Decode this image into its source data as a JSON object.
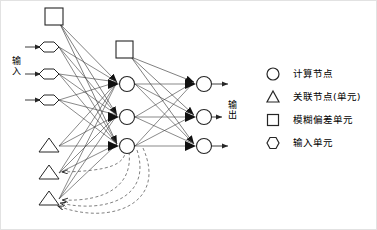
{
  "figure": {
    "title": "",
    "type": "neural-network-architecture-diagram"
  },
  "labels": {
    "input": "输入",
    "output": "输出"
  },
  "legend": {
    "items": [
      {
        "icon": "circle-icon",
        "shape": "circle",
        "label": "计算节点"
      },
      {
        "icon": "triangle-icon",
        "shape": "triangle",
        "label": "关联节点(单元)"
      },
      {
        "icon": "square-icon",
        "shape": "square",
        "label": "模糊偏差单元"
      },
      {
        "icon": "hexagon-icon",
        "shape": "hexagon",
        "label": "输入单元"
      }
    ]
  },
  "colors": {
    "stroke": "#262626",
    "fill": "#ffffff",
    "dashed": "#555555",
    "frame": "#e2e2e2",
    "text": "#000000"
  },
  "network": {
    "layers": [
      {
        "name": "input-layer",
        "node_shape": "hexagon",
        "count": 3,
        "nodes": [
          {
            "id": "in-1",
            "cx": 50,
            "cy": 47
          },
          {
            "id": "in-2",
            "cx": 50,
            "cy": 74
          },
          {
            "id": "in-3",
            "cx": 50,
            "cy": 100
          }
        ]
      },
      {
        "name": "association-layer",
        "node_shape": "triangle",
        "count": 3,
        "nodes": [
          {
            "id": "assoc-1",
            "cx": 50,
            "cy": 146
          },
          {
            "id": "assoc-2",
            "cx": 50,
            "cy": 173
          },
          {
            "id": "assoc-3",
            "cx": 50,
            "cy": 199
          }
        ]
      },
      {
        "name": "hidden-layer",
        "node_shape": "circle",
        "count": 3,
        "nodes": [
          {
            "id": "hid-1",
            "cx": 127,
            "cy": 84
          },
          {
            "id": "hid-2",
            "cx": 127,
            "cy": 117
          },
          {
            "id": "hid-3",
            "cx": 127,
            "cy": 146
          }
        ]
      },
      {
        "name": "output-layer",
        "node_shape": "circle",
        "count": 3,
        "nodes": [
          {
            "id": "out-1",
            "cx": 204,
            "cy": 84
          },
          {
            "id": "out-2",
            "cx": 204,
            "cy": 117
          },
          {
            "id": "out-3",
            "cx": 204,
            "cy": 146
          }
        ]
      },
      {
        "name": "bias-units",
        "node_shape": "square",
        "count": 2,
        "nodes": [
          {
            "id": "bias-1",
            "cx": 54,
            "cy": 17
          },
          {
            "id": "bias-2",
            "cx": 124,
            "cy": 50
          }
        ]
      }
    ],
    "feedback_connections": 3,
    "input_arrows": 3,
    "output_arrows": 3
  }
}
